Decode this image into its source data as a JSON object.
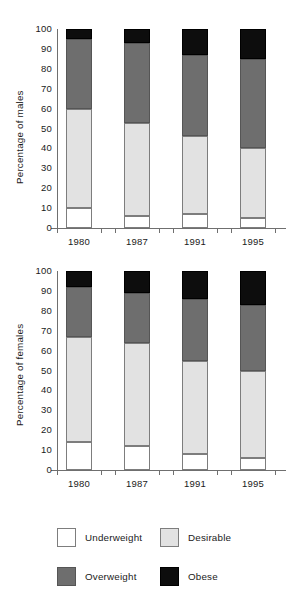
{
  "chart_data": [
    {
      "type": "bar",
      "stacked": true,
      "title": "",
      "xlabel": "",
      "ylabel": "Percentage of males",
      "categories": [
        "1980",
        "1987",
        "1991",
        "1995"
      ],
      "ylim": [
        0,
        100
      ],
      "yticks": [
        0,
        10,
        20,
        30,
        40,
        50,
        60,
        70,
        80,
        90,
        100
      ],
      "grid": false,
      "legend_position": "bottom",
      "series": [
        {
          "name": "Underweight",
          "color": "#ffffff",
          "values": [
            10,
            6,
            7,
            5
          ]
        },
        {
          "name": "Desirable",
          "color": "#e2e2e2",
          "values": [
            50,
            47,
            39,
            35
          ]
        },
        {
          "name": "Overweight",
          "color": "#6e6e6e",
          "values": [
            35,
            40,
            41,
            45
          ]
        },
        {
          "name": "Obese",
          "color": "#0d0d0d",
          "values": [
            5,
            7,
            13,
            15
          ]
        }
      ],
      "cumulative_tops": [
        {
          "category": "1980",
          "underweight_top": 10,
          "desirable_top": 60,
          "overweight_top": 95,
          "obese_top": 100
        },
        {
          "category": "1987",
          "underweight_top": 6,
          "desirable_top": 53,
          "overweight_top": 93,
          "obese_top": 100
        },
        {
          "category": "1991",
          "underweight_top": 7,
          "desirable_top": 46,
          "overweight_top": 87,
          "obese_top": 100
        },
        {
          "category": "1995",
          "underweight_top": 5,
          "desirable_top": 40,
          "overweight_top": 85,
          "obese_top": 100
        }
      ]
    },
    {
      "type": "bar",
      "stacked": true,
      "title": "",
      "xlabel": "",
      "ylabel": "Percentage of females",
      "categories": [
        "1980",
        "1987",
        "1991",
        "1995"
      ],
      "ylim": [
        0,
        100
      ],
      "yticks": [
        0,
        10,
        20,
        30,
        40,
        50,
        60,
        70,
        80,
        90,
        100
      ],
      "grid": false,
      "legend_position": "bottom",
      "series": [
        {
          "name": "Underweight",
          "color": "#ffffff",
          "values": [
            14,
            12,
            8,
            6
          ]
        },
        {
          "name": "Desirable",
          "color": "#e2e2e2",
          "values": [
            53,
            52,
            47,
            44
          ]
        },
        {
          "name": "Overweight",
          "color": "#6e6e6e",
          "values": [
            25,
            25,
            31,
            33
          ]
        },
        {
          "name": "Obese",
          "color": "#0d0d0d",
          "values": [
            8,
            11,
            14,
            17
          ]
        }
      ],
      "cumulative_tops": [
        {
          "category": "1980",
          "underweight_top": 14,
          "desirable_top": 67,
          "overweight_top": 92,
          "obese_top": 100
        },
        {
          "category": "1987",
          "underweight_top": 12,
          "desirable_top": 64,
          "overweight_top": 89,
          "obese_top": 100
        },
        {
          "category": "1991",
          "underweight_top": 8,
          "desirable_top": 55,
          "overweight_top": 86,
          "obese_top": 100
        },
        {
          "category": "1995",
          "underweight_top": 6,
          "desirable_top": 50,
          "overweight_top": 83,
          "obese_top": 100
        }
      ]
    }
  ],
  "charts": {
    "males": {
      "ylabel": "Percentage of males",
      "yticks": [
        "100",
        "90",
        "80",
        "70",
        "60",
        "50",
        "40",
        "30",
        "20",
        "10",
        "0"
      ],
      "xticks": [
        "1980",
        "1987",
        "1991",
        "1995"
      ]
    },
    "females": {
      "ylabel": "Percentage of females",
      "yticks": [
        "100",
        "90",
        "80",
        "70",
        "60",
        "50",
        "40",
        "30",
        "20",
        "10",
        "0"
      ],
      "xticks": [
        "1980",
        "1987",
        "1991",
        "1995"
      ]
    }
  },
  "legend": {
    "items": [
      {
        "label": "Underweight",
        "color": "#ffffff"
      },
      {
        "label": "Desirable",
        "color": "#e2e2e2"
      },
      {
        "label": "Overweight",
        "color": "#6e6e6e"
      },
      {
        "label": "Obese",
        "color": "#0d0d0d"
      }
    ]
  }
}
